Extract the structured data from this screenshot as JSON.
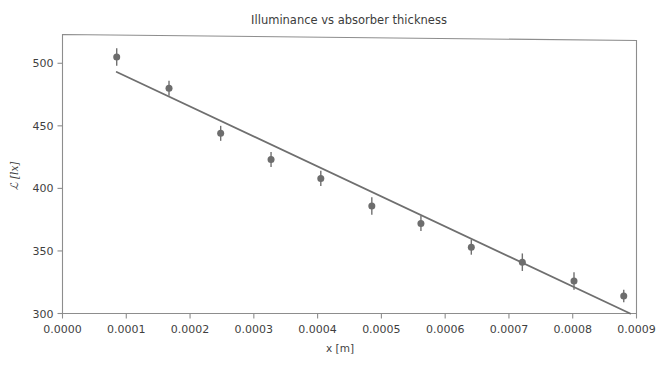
{
  "chart_data": {
    "type": "scatter",
    "title": "Illuminance vs absorber thickness",
    "xlabel": "x [m]",
    "ylabel": "ℒ [lx]",
    "xlim": [
      0.0,
      0.0009
    ],
    "ylim": [
      300,
      523
    ],
    "grid": false,
    "legend": null,
    "x": [
      8.5e-05,
      0.000167,
      0.000248,
      0.000327,
      0.000405,
      0.000485,
      0.000562,
      0.000641,
      0.000721,
      0.000802,
      0.00088
    ],
    "values": [
      505,
      480,
      444,
      423,
      408,
      386,
      372,
      353,
      341,
      326,
      314
    ],
    "yerr": [
      7,
      6,
      6,
      6,
      6,
      7,
      6,
      6,
      7,
      7,
      5
    ],
    "series": [
      {
        "name": "measured points",
        "type": "scatter-errorbar",
        "color": "#6d6d6d",
        "x": [
          8.5e-05,
          0.000167,
          0.000248,
          0.000327,
          0.000405,
          0.000485,
          0.000562,
          0.000641,
          0.000721,
          0.000802,
          0.00088
        ],
        "values": [
          505,
          480,
          444,
          423,
          408,
          386,
          372,
          353,
          341,
          326,
          314
        ],
        "yerr": [
          7,
          6,
          6,
          6,
          6,
          7,
          6,
          6,
          7,
          7,
          5
        ]
      },
      {
        "name": "linear fit",
        "type": "line",
        "color": "#6f6f6f",
        "x": [
          8.5e-05,
          0.00089
        ],
        "values": [
          493,
          300
        ]
      }
    ],
    "xticks": [
      0.0,
      0.0001,
      0.0002,
      0.0003,
      0.0004,
      0.0005,
      0.0006,
      0.0007,
      0.0008,
      0.0009
    ],
    "xticklabels": [
      "0.0000",
      "0.0001",
      "0.0002",
      "0.0003",
      "0.0004",
      "0.0005",
      "0.0006",
      "0.0007",
      "0.0008",
      "0.0009"
    ],
    "yticks": [
      300,
      350,
      400,
      450,
      500
    ],
    "yticklabels": [
      "300",
      "350",
      "400",
      "450",
      "500"
    ]
  },
  "colors": {
    "marker": "#6d6d6d",
    "fit_line": "#6f6f6f",
    "axis": "#8d8d8d",
    "text": "#3f3f3f",
    "background": "#ffffff"
  }
}
